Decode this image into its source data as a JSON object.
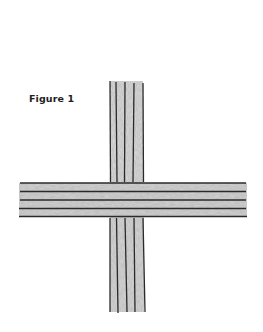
{
  "figure": {
    "caption": "Figure 1",
    "line_color": "#2a2a2a",
    "shade_color": "#b8b8b8",
    "vertical_bundle": {
      "line_count": 5,
      "x_positions": [
        110,
        116,
        125,
        134,
        143
      ],
      "top_segment": [
        81,
        182
      ],
      "bottom_segment": [
        218,
        312
      ]
    },
    "horizontal_bundle": {
      "line_count": 5,
      "y_positions": [
        183,
        191,
        200,
        208,
        216
      ],
      "x_range": [
        19,
        247
      ]
    }
  }
}
